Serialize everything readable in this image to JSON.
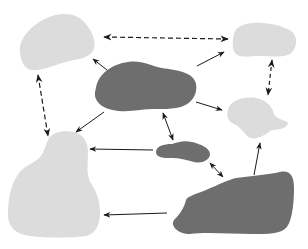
{
  "diagram": {
    "type": "blob-network",
    "colors": {
      "background": "#ffffff",
      "light_blob": "#dcdcdc",
      "dark_blob": "#6e6e6e",
      "arrow": "#1a1a1a"
    },
    "nodes": [
      {
        "id": "top-left",
        "tone": "light"
      },
      {
        "id": "top-right",
        "tone": "light"
      },
      {
        "id": "center",
        "tone": "dark"
      },
      {
        "id": "mid-right",
        "tone": "light"
      },
      {
        "id": "small-center",
        "tone": "dark"
      },
      {
        "id": "bottom-left",
        "tone": "light"
      },
      {
        "id": "bottom-right",
        "tone": "dark"
      }
    ],
    "edges": [
      {
        "from": "top-left",
        "to": "top-right",
        "style": "dashed",
        "direction": "both"
      },
      {
        "from": "top-left",
        "to": "bottom-left",
        "style": "dashed",
        "direction": "both"
      },
      {
        "from": "top-right",
        "to": "mid-right",
        "style": "dashed",
        "direction": "both"
      },
      {
        "from": "center",
        "to": "top-left",
        "style": "solid",
        "direction": "forward"
      },
      {
        "from": "center",
        "to": "top-right",
        "style": "solid",
        "direction": "forward"
      },
      {
        "from": "center",
        "to": "mid-right",
        "style": "solid",
        "direction": "forward"
      },
      {
        "from": "center",
        "to": "bottom-left",
        "style": "solid",
        "direction": "forward"
      },
      {
        "from": "center",
        "to": "small-center",
        "style": "solid",
        "direction": "both"
      },
      {
        "from": "small-center",
        "to": "bottom-left",
        "style": "solid",
        "direction": "forward"
      },
      {
        "from": "small-center",
        "to": "bottom-right",
        "style": "solid",
        "direction": "both"
      },
      {
        "from": "bottom-right",
        "to": "mid-right",
        "style": "solid",
        "direction": "forward"
      },
      {
        "from": "bottom-right",
        "to": "bottom-left",
        "style": "solid",
        "direction": "forward"
      }
    ]
  }
}
